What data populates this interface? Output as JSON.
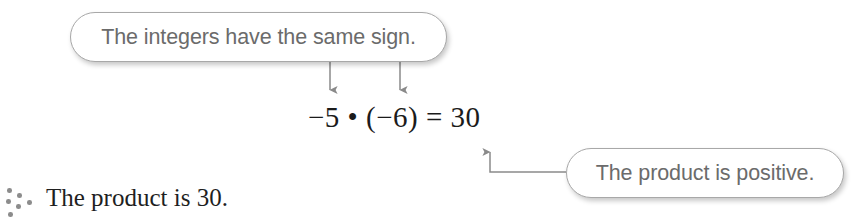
{
  "page": {
    "background_color": "#ffffff",
    "width": 864,
    "height": 223
  },
  "callouts": [
    {
      "id": "same-sign",
      "text": "The integers have the same sign.",
      "text_color": "#6b6b6b",
      "border_color": "#a8a8a8",
      "fill_color": "#ffffff",
      "points_to": "both-factors"
    },
    {
      "id": "positive",
      "text": "The product is positive.",
      "text_color": "#6b6b6b",
      "border_color": "#a8a8a8",
      "fill_color": "#ffffff",
      "points_to": "product"
    }
  ],
  "equation": {
    "text": "−5 • (−6) = 30",
    "color": "#1b1b1b",
    "left_factor": "−5",
    "right_factor": "−6",
    "product": "30",
    "operator": "•"
  },
  "conclusion": {
    "text": "The product is 30.",
    "color": "#1f1f1f",
    "bullet_icon": "scatter-dots-icon",
    "bullet_dot_color": "#8c8c8c"
  },
  "connectors": {
    "color": "#8a8a8a",
    "arrows": [
      {
        "name": "arrow-to-left-factor",
        "direction": "down"
      },
      {
        "name": "arrow-to-right-factor",
        "direction": "down"
      },
      {
        "name": "arrow-to-product",
        "direction": "up-elbow"
      }
    ]
  }
}
